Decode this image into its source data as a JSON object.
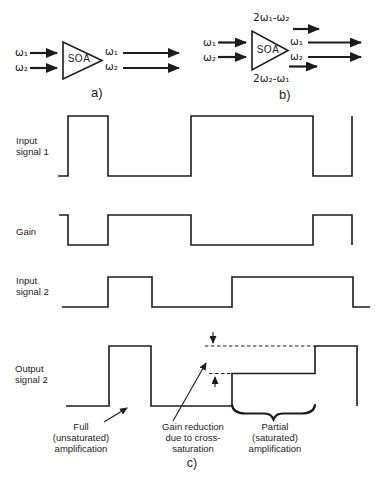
{
  "figure": {
    "background": "#ffffff",
    "line_color": "#1c1c1c"
  },
  "diagrams": {
    "a": {
      "caption": "a)",
      "soa": "SOA",
      "input1": "ω₁",
      "input2": "ω₂",
      "output1": "ω₁",
      "output2": "ω₂"
    },
    "b": {
      "caption": "b)",
      "soa": "SOA",
      "input1": "ω₁",
      "input2": "ω₂",
      "output1": "ω₁",
      "output2": "ω₂",
      "fwm_top": "2ω₁-ω₂",
      "fwm_bottom": "2ω₂-ω₁"
    }
  },
  "waveforms": [
    {
      "name": "input-signal-1",
      "label": [
        "Input",
        "signal 1"
      ]
    },
    {
      "name": "gain",
      "label": [
        "Gain"
      ]
    },
    {
      "name": "input-signal-2",
      "label": [
        "Input",
        "signal 2"
      ]
    },
    {
      "name": "output-signal-2",
      "label": [
        "Output",
        "signal 2"
      ]
    }
  ],
  "annotations": {
    "full": [
      "Full",
      "(unsaturated)",
      "amplification"
    ],
    "gain_reduction": [
      "Gain reduction",
      "due to cross-",
      "saturation"
    ],
    "partial": [
      "Partial",
      "(saturated)",
      "amplification"
    ],
    "caption": "c)"
  },
  "geometry": {
    "triangles": [
      {
        "name": "soa-triangle-a",
        "points": "63,42 63,79 102,60.5"
      },
      {
        "name": "soa-triangle-b",
        "points": "252,31 252,70 288,50.5"
      }
    ],
    "thick_arrows": [
      {
        "name": "a-input1-arrow",
        "x1": 30,
        "y1": 53,
        "x2": 57,
        "y2": 53
      },
      {
        "name": "a-input2-arrow",
        "x1": 30,
        "y1": 68,
        "x2": 57,
        "y2": 68
      },
      {
        "name": "a-output1-arrow",
        "x1": 123,
        "y1": 53,
        "x2": 179,
        "y2": 53
      },
      {
        "name": "a-output2-arrow",
        "x1": 123,
        "y1": 68,
        "x2": 179,
        "y2": 68
      },
      {
        "name": "b-input1-arrow",
        "x1": 218,
        "y1": 42.5,
        "x2": 246,
        "y2": 42.5
      },
      {
        "name": "b-input2-arrow",
        "x1": 218,
        "y1": 57,
        "x2": 246,
        "y2": 57
      },
      {
        "name": "b-fwm-top-arrow",
        "x1": 293,
        "y1": 29,
        "x2": 319,
        "y2": 29
      },
      {
        "name": "b-output1-arrow",
        "x1": 308,
        "y1": 42.5,
        "x2": 361,
        "y2": 42.5
      },
      {
        "name": "b-output2-arrow",
        "x1": 308,
        "y1": 57,
        "x2": 361,
        "y2": 57
      },
      {
        "name": "b-fwm-bottom-arrow",
        "x1": 289,
        "y1": 66.5,
        "x2": 317,
        "y2": 66.5
      }
    ],
    "waveform_lines": [
      {
        "name": "input-signal-1-trace",
        "points": [
          [
            58,
            176
          ],
          [
            68,
            176
          ],
          [
            68,
            116
          ],
          [
            108,
            116
          ],
          [
            108,
            176
          ],
          [
            191,
            176
          ],
          [
            191,
            116
          ],
          [
            313,
            116
          ],
          [
            313,
            176
          ],
          [
            352,
            176
          ],
          [
            352,
            116
          ]
        ]
      },
      {
        "name": "gain-trace",
        "points": [
          [
            59,
            215
          ],
          [
            68,
            215
          ],
          [
            68,
            245
          ],
          [
            108,
            245
          ],
          [
            108,
            215
          ],
          [
            191,
            215
          ],
          [
            191,
            245
          ],
          [
            313,
            245
          ],
          [
            313,
            215
          ],
          [
            352,
            215
          ],
          [
            352,
            245
          ]
        ]
      },
      {
        "name": "input-signal-2-trace",
        "points": [
          [
            62,
            307
          ],
          [
            108,
            307
          ],
          [
            108,
            277
          ],
          [
            152,
            277
          ],
          [
            152,
            307
          ],
          [
            232,
            307
          ],
          [
            232,
            277
          ],
          [
            353,
            277
          ],
          [
            353,
            307
          ],
          [
            370,
            307
          ]
        ]
      },
      {
        "name": "output-signal-2-trace",
        "points": [
          [
            66,
            406
          ],
          [
            109,
            406
          ],
          [
            109,
            346
          ],
          [
            151,
            346
          ],
          [
            151,
            406
          ],
          [
            232,
            406
          ],
          [
            232,
            373.5
          ],
          [
            315,
            373.5
          ],
          [
            315,
            346
          ],
          [
            357,
            346
          ],
          [
            357,
            406
          ]
        ]
      }
    ],
    "dashed_lines": [
      {
        "name": "full-level-dashed-line",
        "x1": 205,
        "y1": 346,
        "x2": 315,
        "y2": 346
      },
      {
        "name": "saturated-level-dashed-line",
        "x1": 209,
        "y1": 373.5,
        "x2": 231,
        "y2": 373.5
      }
    ],
    "thin_arrows": [
      {
        "name": "gap-arrow-down",
        "x1": 213,
        "y1": 332,
        "x2": 213,
        "y2": 343
      },
      {
        "name": "gap-arrow-up",
        "x1": 215,
        "y1": 387,
        "x2": 215,
        "y2": 377
      },
      {
        "name": "full-amplification-pointer",
        "x1": 104,
        "y1": 422,
        "x2": 127,
        "y2": 408
      },
      {
        "name": "gain-reduction-pointer",
        "x1": 173,
        "y1": 421,
        "x2": 206,
        "y2": 363
      }
    ],
    "braces": [
      {
        "name": "partial-region-brace",
        "d": "M232 405 C233 411.5 238 413.5 245 413.5 L263 413.5 C269 413.5 271.5 415 273.5 419.5 C275.5 415 278 413.5 284 413.5 L302 413.5 C309 413.5 314 411.5 315 405"
      }
    ]
  }
}
